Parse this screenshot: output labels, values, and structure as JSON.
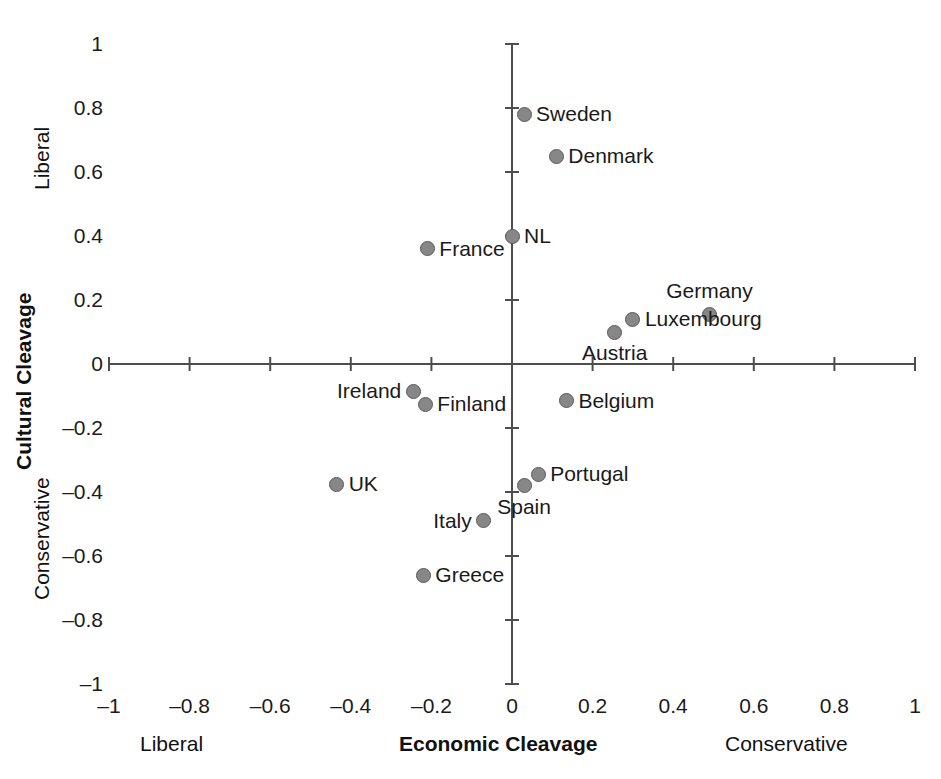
{
  "chart_data": {
    "type": "scatter",
    "title": "",
    "xlabel": "Economic Cleavage",
    "ylabel": "Cultural Cleavage",
    "xlim": [
      -1,
      1
    ],
    "ylim": [
      -1,
      1
    ],
    "grid": false,
    "legend": "none",
    "x_axis_end_labels": {
      "left": "Liberal",
      "right": "Conservative"
    },
    "y_axis_end_labels": {
      "top": "Liberal",
      "bottom": "Conservative"
    },
    "xticks": [
      "-1",
      "-0.8",
      "-0.6",
      "-0.4",
      "-0.2",
      "0",
      "0.2",
      "0.4",
      "0.6",
      "0.8",
      "1"
    ],
    "xtick_values": [
      -1,
      -0.8,
      -0.6,
      -0.4,
      -0.2,
      0,
      0.2,
      0.4,
      0.6,
      0.8,
      1
    ],
    "yticks": [
      "1",
      "0.8",
      "0.6",
      "0.4",
      "0.2",
      "0",
      "-0.2",
      "-0.4",
      "-0.6",
      "-0.8",
      "-1"
    ],
    "ytick_values": [
      1,
      0.8,
      0.6,
      0.4,
      0.2,
      0,
      -0.2,
      -0.4,
      -0.6,
      -0.8,
      -1
    ],
    "marker_color": "#878787",
    "marker_edge_color": "#5a5a5a",
    "axis_color": "#4d4d4d",
    "points": [
      {
        "label": "Sweden",
        "x": 0.03,
        "y": 0.78,
        "label_pos": "right"
      },
      {
        "label": "Denmark",
        "x": 0.11,
        "y": 0.65,
        "label_pos": "right"
      },
      {
        "label": "NL",
        "x": 0.0,
        "y": 0.4,
        "label_pos": "right"
      },
      {
        "label": "France",
        "x": -0.21,
        "y": 0.36,
        "label_pos": "right"
      },
      {
        "label": "Germany",
        "x": 0.49,
        "y": 0.155,
        "label_pos": "above"
      },
      {
        "label": "Luxembourg",
        "x": 0.3,
        "y": 0.14,
        "label_pos": "right"
      },
      {
        "label": "Austria",
        "x": 0.255,
        "y": 0.1,
        "label_pos": "below"
      },
      {
        "label": "Ireland",
        "x": -0.245,
        "y": -0.085,
        "label_pos": "left"
      },
      {
        "label": "Finland",
        "x": -0.215,
        "y": -0.125,
        "label_pos": "right"
      },
      {
        "label": "Belgium",
        "x": 0.135,
        "y": -0.115,
        "label_pos": "right"
      },
      {
        "label": "UK",
        "x": -0.435,
        "y": -0.375,
        "label_pos": "right"
      },
      {
        "label": "Portugal",
        "x": 0.065,
        "y": -0.345,
        "label_pos": "right"
      },
      {
        "label": "Spain",
        "x": 0.03,
        "y": -0.38,
        "label_pos": "below"
      },
      {
        "label": "Italy",
        "x": -0.07,
        "y": -0.49,
        "label_pos": "left"
      },
      {
        "label": "Greece",
        "x": -0.22,
        "y": -0.66,
        "label_pos": "right"
      }
    ]
  }
}
